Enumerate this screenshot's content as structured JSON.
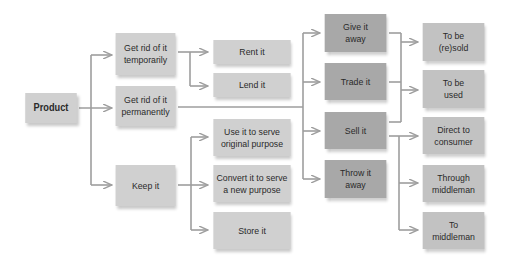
{
  "diagram": {
    "type": "flowchart",
    "root": {
      "label": "Product"
    },
    "level1": [
      {
        "label": "Get rid of it temporarily"
      },
      {
        "label": "Get rid of it permanently"
      },
      {
        "label": "Keep it"
      }
    ],
    "level2": [
      {
        "label": "Rent it"
      },
      {
        "label": "Lend it"
      },
      {
        "label": "Use it to serve original purpose"
      },
      {
        "label": "Convert it to serve a new purpose"
      },
      {
        "label": "Store it"
      }
    ],
    "level3": [
      {
        "label": "Give it away"
      },
      {
        "label": "Trade it"
      },
      {
        "label": "Sell it"
      },
      {
        "label": "Throw it away"
      }
    ],
    "level4": [
      {
        "label": "To be (re)sold"
      },
      {
        "label": "To be used"
      },
      {
        "label": "Direct to consumer"
      },
      {
        "label": "Through middleman"
      },
      {
        "label": "To middleman"
      }
    ],
    "colors": {
      "light_box": "#d0d0d0",
      "dark_box": "#a8a8a8",
      "right_box": "#c2c2c2",
      "connector": "#9e9e9e",
      "text": "#2a2a2a"
    }
  }
}
